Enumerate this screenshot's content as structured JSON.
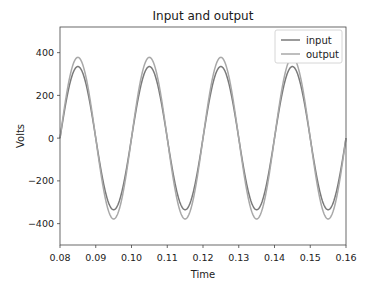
{
  "chart_data": {
    "type": "line",
    "title": "Input and output",
    "xlabel": "Time",
    "ylabel": "Volts",
    "xlim": [
      0.08,
      0.16
    ],
    "ylim": [
      -500,
      520
    ],
    "xticks": [
      "0.08",
      "0.09",
      "0.10",
      "0.11",
      "0.12",
      "0.13",
      "0.14",
      "0.15",
      "0.16"
    ],
    "yticks": [
      "400",
      "200",
      "0",
      "−200",
      "−400"
    ],
    "ytick_values": [
      400,
      200,
      0,
      -200,
      -400
    ],
    "xtick_values": [
      0.08,
      0.09,
      0.1,
      0.11,
      0.12,
      0.13,
      0.14,
      0.15,
      0.16
    ],
    "grid": false,
    "legend_position": "upper right",
    "series": [
      {
        "name": "input",
        "color": "#7a7a7a",
        "waveform": "sine",
        "amplitude": 335,
        "frequency_hz": 50,
        "phase_start": 0.08
      },
      {
        "name": "output",
        "color": "#a8a8a8",
        "waveform": "sine",
        "amplitude": 378,
        "frequency_hz": 50,
        "phase_start": 0.08
      }
    ]
  },
  "legend": {
    "items": [
      {
        "label": "input",
        "color": "#7a7a7a"
      },
      {
        "label": "output",
        "color": "#a8a8a8"
      }
    ]
  }
}
